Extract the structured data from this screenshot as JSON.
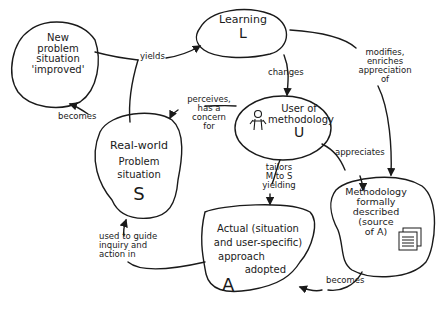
{
  "diagram": {
    "nodes": {
      "new_problem": {
        "lines": [
          "New",
          "problem",
          "situation",
          "'improved'"
        ]
      },
      "learning": {
        "title": "Learning",
        "letter": "L"
      },
      "user": {
        "line1": "User of",
        "line2": "methodology",
        "letter": "U",
        "icon": "person-icon"
      },
      "real_world": {
        "line1": "Real-world",
        "line2": "Problem",
        "line3": "situation",
        "letter": "S"
      },
      "actual": {
        "line1": "Actual (situation",
        "line2": "and user-specific)",
        "line3": "approach",
        "line4": "adopted",
        "letter": "A"
      },
      "methodology": {
        "line1": "Methodology",
        "line2": "formally",
        "line3": "described",
        "line4": "(source",
        "line5": "of A)",
        "icon": "document-icon"
      }
    },
    "edges": {
      "yields": "yields",
      "becomes_top": "becomes",
      "changes": "changes",
      "modifies": [
        "modifies,",
        "enriches",
        "appreciation",
        "of"
      ],
      "perceives": [
        "perceives,",
        "has a",
        "concern",
        "for"
      ],
      "appreciates": "appreciates",
      "tailors": [
        "tailors",
        "M to S",
        "yielding"
      ],
      "used_to_guide": [
        "used to guide",
        "inquiry and",
        "action in"
      ],
      "becomes_bottom": "becomes"
    },
    "colors": {
      "ink": "#1a1a1a",
      "background": "#ffffff"
    }
  }
}
